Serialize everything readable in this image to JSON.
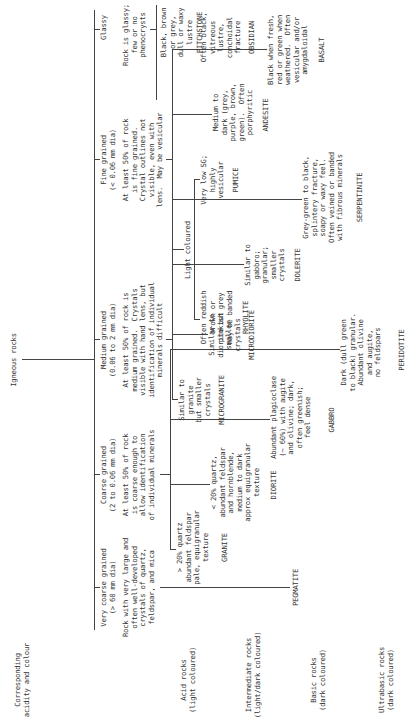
{
  "root": {
    "label": "Igneous rocks"
  },
  "row_header": "Corresponding\nacidity and colour",
  "rows": [
    {
      "label": "Acid rocks\n(light coloured)"
    },
    {
      "label": "Intermediate rocks\n(light/dark coloured)"
    },
    {
      "label": "Basic rocks\n(dark coloured)"
    },
    {
      "label": "Ultrabasic rocks\n(dark coloured)"
    }
  ],
  "categories": {
    "very_coarse": {
      "title": "Very coarse grained\n(> 60 mm dia)",
      "desc": "Rock with very large and\noften well-developed\ncrystals of quartz,\nfeldspar, and mica",
      "rock": "PEGMATITE"
    },
    "coarse": {
      "title": "Coarse grained\n(2 to 0.06 mm dia)",
      "desc": "At least 50% of rock\nis coarse enough to\nallow identification\nof individual minerals",
      "items": [
        {
          "desc": "> 20% quartz\nabundant feldspar\npale, equigranular\ntexture",
          "rock": "GRANITE"
        },
        {
          "desc": "< 20% quartz,\nabundant feldspar\nand hornblende,\nmedium to dark\napprox equigranular\ntexture",
          "rock": "DIORITE"
        },
        {
          "desc": "Abundant plagioclase\n(~ 60%) with augite\nand olivine; dark,\noften greenish;\nfeel dense",
          "rock": "GABBRO"
        },
        {
          "desc": "Dark (dull green\nto black) granular.\nAbundant olivine\nand augite,\nno feldspars",
          "rock": "PERIDOTITE"
        }
      ]
    },
    "medium": {
      "title": "Medium grained\n(0.06 to 2 mm dia)",
      "desc": "At least 50% of rock is\nmedium grained.  Crystals\nvisible with hand lens, but\nidentification of individual\nminerals difficult",
      "items": [
        {
          "desc": "Similar to\ngranite\nbut smaller\ncrystals",
          "rock": "MICROGRANITE"
        },
        {
          "desc": "Similar to\ndiorite but\nsmaller\ncrystals",
          "rock": "MICRODIORITE"
        },
        {
          "desc": "Similar to\ngabbro;\ngranular;\nsmaller\ncrystals",
          "rock": "DOLERITE"
        },
        {
          "desc": "Grey-green to black,\nsplintery fracture,\nsoapy or waxy feel.\nOften veined or banded\nwith fibrous minerals",
          "rock": "SERPENTINITE"
        }
      ]
    },
    "fine": {
      "title": "Fine grained\n(< 0.06 mm dia)",
      "desc": "At least 50% of rock\nis fine grained.\nCrystal outlines not\nvisible, even with\nlens.  May be vesicular",
      "light_coloured": {
        "label": "Light coloured",
        "items": [
          {
            "desc": "Often reddish\nbrown or\npinkish grey\nmay be banded",
            "rock": "RHYOLITE"
          },
          {
            "desc": "Very low SG;\nhighly\nvesicular",
            "rock": "PUMICE"
          }
        ]
      },
      "items": [
        {
          "desc": "Medium to\ndark (grey,\npurple, brown,\ngreen).  Often\nporphyritic",
          "rock": "ANDESITE"
        },
        {
          "desc": "Black when fresh,\nred or green when\nweathered.  Often\nvesicular and/or\namygdaloidal",
          "rock": "BASALT"
        }
      ]
    },
    "glassy": {
      "title": "Glassy",
      "desc": "Rock is glassy;\nfew or no\nphenocrysts",
      "items": [
        {
          "desc": "Often black,\nvitreous\nlustre,\nconchoidal\nfracture",
          "rock": "OBSIDIAN"
        },
        {
          "desc": "Black, brown\nor grey,\ndull or waxy\nlustre",
          "rock": "PITCHSTONE"
        }
      ]
    }
  }
}
